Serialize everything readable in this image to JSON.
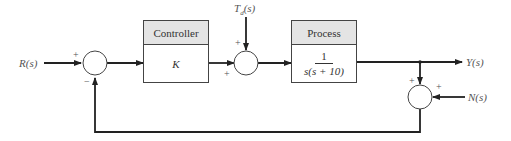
{
  "diagram": {
    "type": "closed-loop feedback block diagram",
    "signals": {
      "input": "R(s)",
      "disturbance": "T_d(s)",
      "output": "Y(s)",
      "noise": "N(s)"
    },
    "blocks": [
      {
        "id": "controller",
        "header": "Controller",
        "transfer_function": "K"
      },
      {
        "id": "process",
        "header": "Process",
        "numerator": "1",
        "denominator": "s(s + 10)"
      }
    ],
    "summing_junctions": [
      {
        "id": "error-sum",
        "signs": {
          "top": "+",
          "bottom": "−"
        }
      },
      {
        "id": "disturbance-sum",
        "signs": {
          "top": "+",
          "left": "+"
        }
      },
      {
        "id": "noise-sum",
        "signs": {
          "top": "+",
          "right": "+"
        }
      }
    ]
  }
}
